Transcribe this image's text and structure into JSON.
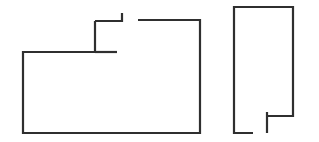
{
  "canvas": {
    "width": 319,
    "height": 142,
    "background_color": "#ffffff",
    "title": "Two-part outline line drawing"
  },
  "style": {
    "stroke_color": "#2f2f2f",
    "stroke_width": 2.2,
    "fill": "none"
  },
  "figures": [
    {
      "id": "left-shape",
      "name": "left-outline-shape",
      "description": "Large rectangle-like outline with an upper stepped notch and an open gap along the top edge",
      "paths": [
        {
          "id": "left-main-outline",
          "name": "left-main-outline-path",
          "description": "Main body: from notch inner corner down the left side, across the bottom, up the right side, and left along the top edge to the gap",
          "points": "95,21 95,52 23,52 23,133 200,133 200,20 138,20"
        },
        {
          "id": "left-notch-top",
          "name": "left-notch-top-path",
          "description": "Notch top edge running right from the notch corner to the short vertical stub",
          "points": "95,21 122,21 122,13"
        },
        {
          "id": "left-interior-ledge",
          "name": "left-interior-ledge-path",
          "description": "Short horizontal ledge extending right from the notch base",
          "points": "95,52 117,52"
        }
      ]
    },
    {
      "id": "right-shape",
      "name": "right-outline-shape",
      "description": "Tall narrow rectangle outline with a notch cut into the lower-left and an open gap at the bottom edge",
      "paths": [
        {
          "id": "right-main-outline",
          "name": "right-main-outline-path",
          "description": "Main body: from bottom-left stub up the left side, across the top, down the right side to the notch ledge",
          "points": "253,133 234,133 234,7 293,7 293,116 267,116"
        },
        {
          "id": "right-notch-stem",
          "name": "right-notch-stem-path",
          "description": "Vertical notch wall dropping from the ledge down to the bottom edge line",
          "points": "267,112 267,133"
        }
      ]
    }
  ]
}
